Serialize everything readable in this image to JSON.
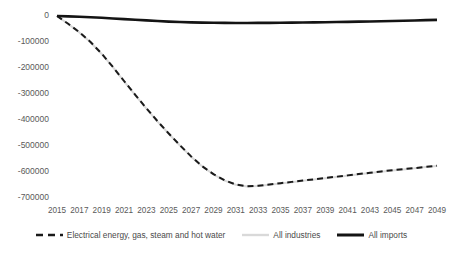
{
  "chart_data": {
    "type": "line",
    "title": "",
    "xlabel": "",
    "ylabel": "",
    "ylim": [
      -700000,
      0
    ],
    "xlim": [
      2015,
      2049
    ],
    "grid": false,
    "legend_position": "bottom",
    "ytick_labels": [
      "0",
      "-100000",
      "-200000",
      "-300000",
      "-400000",
      "-500000",
      "-600000",
      "-700000"
    ],
    "ytick_values": [
      0,
      -100000,
      -200000,
      -300000,
      -400000,
      -500000,
      -600000,
      -700000
    ],
    "xtick_labels": [
      "2015",
      "2017",
      "2019",
      "2021",
      "2023",
      "2025",
      "2027",
      "2029",
      "2031",
      "2033",
      "2035",
      "2037",
      "2039",
      "2041",
      "2043",
      "2045",
      "2047",
      "2049"
    ],
    "xtick_values": [
      2015,
      2017,
      2019,
      2021,
      2023,
      2025,
      2027,
      2029,
      2031,
      2033,
      2035,
      2037,
      2039,
      2041,
      2043,
      2045,
      2047,
      2049
    ],
    "x": [
      2015,
      2016,
      2017,
      2018,
      2019,
      2020,
      2021,
      2022,
      2023,
      2024,
      2025,
      2026,
      2027,
      2028,
      2029,
      2030,
      2031,
      2032,
      2033,
      2034,
      2035,
      2036,
      2037,
      2038,
      2039,
      2040,
      2041,
      2042,
      2043,
      2044,
      2045,
      2046,
      2047,
      2048,
      2049
    ],
    "series": [
      {
        "name": "Electrical energy, gas, steam and hot water",
        "style": "dashed",
        "color": "#1a1a1a",
        "width": 2.0,
        "values": [
          0,
          -30000,
          -62000,
          -100000,
          -145000,
          -196000,
          -250000,
          -303000,
          -355000,
          -405000,
          -452000,
          -497000,
          -540000,
          -578000,
          -608000,
          -632000,
          -648000,
          -655000,
          -653000,
          -648000,
          -643000,
          -638000,
          -633000,
          -628000,
          -623000,
          -618000,
          -613000,
          -608000,
          -603000,
          -598000,
          -593000,
          -589000,
          -585000,
          -580000,
          -576000
        ]
      },
      {
        "name": "All industries",
        "style": "solid",
        "color": "#d9d9d9",
        "width": 2.0,
        "values": [
          0,
          -31000,
          -63000,
          -101000,
          -146000,
          -197000,
          -251000,
          -304000,
          -356000,
          -406000,
          -453000,
          -498000,
          -541000,
          -579000,
          -609000,
          -633000,
          -649000,
          -656000,
          -654000,
          -649000,
          -644000,
          -639000,
          -634000,
          -629000,
          -624000,
          -619000,
          -614000,
          -609000,
          -604000,
          -599000,
          -594000,
          -590000,
          -586000,
          -581000,
          -577000
        ]
      },
      {
        "name": "All imports",
        "style": "solid",
        "color": "#141414",
        "width": 2.6,
        "values": [
          0,
          -1500,
          -3000,
          -5000,
          -7000,
          -9500,
          -12000,
          -14500,
          -17000,
          -19500,
          -21500,
          -23000,
          -24500,
          -25500,
          -26200,
          -26600,
          -26800,
          -26800,
          -26600,
          -26300,
          -26000,
          -25600,
          -25100,
          -24600,
          -24000,
          -23300,
          -22600,
          -21800,
          -21000,
          -20100,
          -19200,
          -18200,
          -17100,
          -16000,
          -14800
        ]
      }
    ]
  },
  "legend": {
    "items": [
      {
        "label": "Electrical energy, gas, steam and hot water",
        "marker": "dashed-line-marker"
      },
      {
        "label": "All industries",
        "marker": "solid-line-marker"
      },
      {
        "label": "All imports",
        "marker": "thick-solid-line-marker"
      }
    ]
  }
}
